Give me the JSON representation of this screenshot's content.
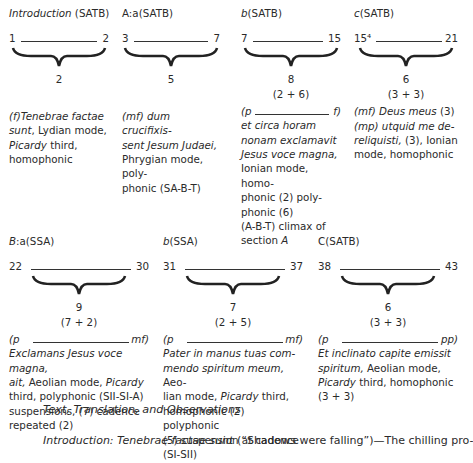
{
  "sections_row1": [
    {
      "title_italic": "Introduction",
      "title_rest": " (SATB)",
      "start": "1",
      "end": "2",
      "count": "2",
      "subcount": "",
      "lines": [
        {
          "italic": "(f)Tenebrae factae",
          "plain": ""
        },
        {
          "italic": "sunt",
          "plain": ", Lydian mode,"
        },
        {
          "italic": "Picardy",
          "plain": " third,"
        },
        {
          "italic": "",
          "plain": "homophonic"
        }
      ]
    },
    {
      "title_italic": "A:a",
      "title_rest": "(SATB)",
      "start": "3",
      "end": "7",
      "count": "5",
      "subcount": "",
      "lines": [
        {
          "italic": "(mf) dum crucifixis-",
          "plain": ""
        },
        {
          "italic": "sent Jesum Judaei,",
          "plain": ""
        },
        {
          "italic": "",
          "plain": "Phrygian mode, poly-"
        },
        {
          "italic": "",
          "plain": "phonic (SA-B-T)"
        }
      ]
    },
    {
      "title_italic": "b",
      "title_rest": "(SATB)",
      "start": "7",
      "end": "15",
      "count": "8",
      "subcount": "(2 + 6)",
      "dyn_left": "(p",
      "dyn_right": "f)",
      "lines": [
        {
          "italic": "et circa horam",
          "plain": ""
        },
        {
          "italic": "nonam exclamavit",
          "plain": ""
        },
        {
          "italic": "Jesus voce magna,",
          "plain": ""
        },
        {
          "italic": "",
          "plain": "Ionian mode, homo-"
        },
        {
          "italic": "",
          "plain": "phonic (2) poly-"
        },
        {
          "italic": "",
          "plain": "phonic (6)"
        },
        {
          "italic": "",
          "plain": "(A-B-T) climax of"
        },
        {
          "italic": "",
          "plain": "section ",
          "tail_italic": "A"
        }
      ]
    },
    {
      "title_italic": "c",
      "title_rest": "(SATB)",
      "start": "15⁴",
      "end": "21",
      "count": "6",
      "subcount": "(3 + 3)",
      "lines": [
        {
          "italic": "(mf) Deus meus",
          "plain": " (3)"
        },
        {
          "italic": "(mp) utquid me de-",
          "plain": ""
        },
        {
          "italic": "reliquisti,",
          "plain": " (3), Ionian"
        },
        {
          "italic": "",
          "plain": "mode, homophonic"
        }
      ]
    }
  ],
  "sections_row2": [
    {
      "title_italic": "B",
      "title_rest": ":a(SSA)",
      "start": "22",
      "end": "30",
      "count": "9",
      "subcount": "(7 + 2)",
      "dyn_left": "(p",
      "dyn_right": "mf)",
      "lines": [
        {
          "italic": "Exclamans Jesus voce magna,",
          "plain": ""
        },
        {
          "italic": "ait,",
          "plain": " Aeolian mode, ",
          "tail_italic": "Picardy"
        },
        {
          "italic": "",
          "plain": "third, polyphonic (SII-SI-A)"
        },
        {
          "italic": "",
          "plain": "suspensions, (7) cadence"
        },
        {
          "italic": "",
          "plain": "repeated (2)"
        }
      ]
    },
    {
      "title_italic": "b",
      "title_rest": "(SSA)",
      "start": "31",
      "end": "37",
      "count": "7",
      "subcount": "(2 + 5)",
      "dyn_left": "(p",
      "dyn_right": "mf)",
      "lines": [
        {
          "italic": "Pater in manus tuas com-",
          "plain": ""
        },
        {
          "italic": "mendo spiritum meum,",
          "plain": " Aeo-"
        },
        {
          "italic": "",
          "plain": "lian mode, ",
          "tail_italic": "Picardy",
          "tail_plain": " third,"
        },
        {
          "italic": "",
          "plain": "homophonic (2) polyphonic"
        },
        {
          "italic": "",
          "plain": "(5) suspension at cadence"
        },
        {
          "italic": "",
          "plain": "(SI-SII)"
        }
      ]
    },
    {
      "title_italic": "",
      "title_rest": "C(SATB)",
      "start": "38",
      "end": "43",
      "count": "6",
      "subcount": "(3 + 3)",
      "dyn_left": "(p",
      "dyn_right": "pp)",
      "lines": [
        {
          "italic": "Et inclinato capite emissit",
          "plain": ""
        },
        {
          "italic": "spiritum,",
          "plain": " Aeolian mode,"
        },
        {
          "italic": "Picardy",
          "plain": " third, homophonic"
        },
        {
          "italic": "",
          "plain": "(3 + 3)"
        }
      ]
    }
  ],
  "heading": "Text, Translation, and Observations",
  "paragraph": {
    "italic": "Introduction: Tenebrae factae sunt",
    "plain": " (“Shadows were falling”)—The chilling pro-"
  }
}
